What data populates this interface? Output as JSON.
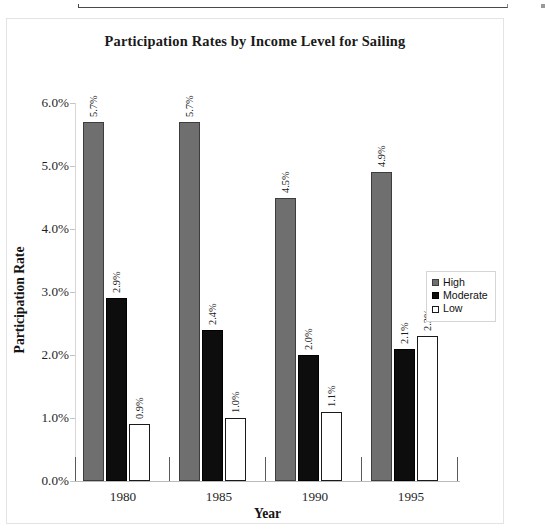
{
  "artifact": {
    "name": "scanned-page-box-edge"
  },
  "chart_data": {
    "type": "bar",
    "title": "Participation Rates by Income Level for Sailing",
    "xlabel": "Year",
    "ylabel": "Participation Rate",
    "categories": [
      "1980",
      "1985",
      "1990",
      "1995"
    ],
    "ylim": [
      0,
      6
    ],
    "ytick_labels": [
      "0.0%",
      "1.0%",
      "2.0%",
      "3.0%",
      "4.0%",
      "5.0%",
      "6.0%"
    ],
    "ytick_values": [
      0,
      1,
      2,
      3,
      4,
      5,
      6
    ],
    "grid": false,
    "legend_position": "right-center",
    "series": [
      {
        "name": "High",
        "color": "#6f6f6f",
        "values": [
          5.7,
          5.7,
          4.5,
          4.9
        ],
        "labels": [
          "5.7%",
          "5.7%",
          "4.5%",
          "4.9%"
        ]
      },
      {
        "name": "Moderate",
        "color": "#0d0d0d",
        "values": [
          2.9,
          2.4,
          2.0,
          2.1
        ],
        "labels": [
          "2.9%",
          "2.4%",
          "2.0%",
          "2.1%"
        ]
      },
      {
        "name": "Low",
        "color": "#ffffff",
        "values": [
          0.9,
          1.0,
          1.1,
          2.3
        ],
        "labels": [
          "0.9%",
          "1.0%",
          "1.1%",
          "2.3%"
        ]
      }
    ]
  },
  "legend": {
    "items": [
      {
        "label": "High"
      },
      {
        "label": "Moderate"
      },
      {
        "label": "Low"
      }
    ]
  }
}
